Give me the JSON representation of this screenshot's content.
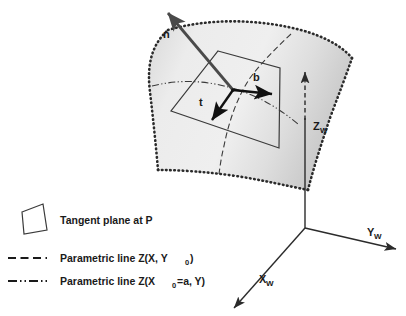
{
  "figure": {
    "background_color": "#ffffff",
    "ink_color": "#1a1a1a"
  },
  "surface": {
    "name": "parametric-surface",
    "fill_light": "#efefef",
    "fill_mid": "#e2e2e2",
    "fill_dark": "#c9c9c9",
    "boundary_style": "dotted",
    "boundary_color": "#2b2b2b"
  },
  "tangent_plane": {
    "name": "tangent-plane-quad",
    "stroke": "#3a3a3a",
    "fill": "none"
  },
  "vectors": [
    {
      "id": "n",
      "label": "n",
      "description": "surface normal vector",
      "direction": "up-left",
      "color": "#4a4a4a"
    },
    {
      "id": "b",
      "label": "b",
      "description": "binormal tangent vector",
      "direction": "right",
      "color": "#111111"
    },
    {
      "id": "t",
      "label": "t",
      "description": "tangent vector",
      "direction": "down",
      "color": "#111111"
    }
  ],
  "axes": [
    {
      "id": "zw",
      "label": "Z",
      "subscript": "W",
      "description": "world Z axis, vertical",
      "color": "#2b2b2b"
    },
    {
      "id": "yw",
      "label": "Y",
      "subscript": "W",
      "description": "world Y axis, to the right",
      "color": "#2b2b2b"
    },
    {
      "id": "xw",
      "label": "X",
      "subscript": "W",
      "description": "world X axis, to the lower left",
      "color": "#2b2b2b"
    }
  ],
  "legend": {
    "name": "figure-legend",
    "items": [
      {
        "id": "tangent-plane",
        "swatch": "quad-outline",
        "text": "Tangent plane at P",
        "text_main": "Tangent plane at P",
        "subscript": "",
        "text_tail": ""
      },
      {
        "id": "parametric-line-x",
        "swatch": "dashed-line",
        "text": "Parametric line Z(X, Y0)",
        "text_main": "Parametric line Z(X, Y",
        "subscript": "0",
        "text_tail": ")"
      },
      {
        "id": "parametric-line-y",
        "swatch": "dash-dot-line",
        "text": "Parametric line Z(X0=a, Y)",
        "text_main": "Parametric line Z(X",
        "subscript": "0",
        "text_tail": "=a, Y)"
      }
    ]
  }
}
